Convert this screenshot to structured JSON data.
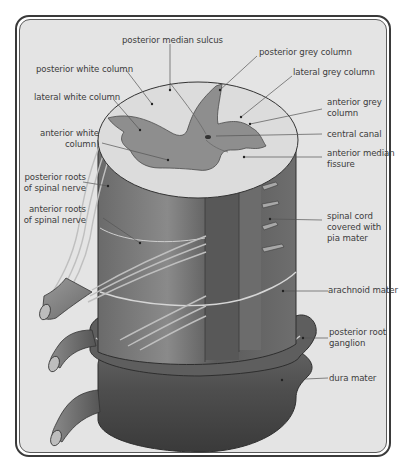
{
  "figure": {
    "colors": {
      "background": "#e4e4e4",
      "frame": "#3a3a3a",
      "white_matter": "#dcdcdc",
      "grey_matter": "#8e8e8e",
      "cord_dark": "#5e5e5e",
      "cord_mid": "#777777",
      "meninges_dark": "#4a4a4a",
      "label_text": "#3c3c3c",
      "leader_line": "#555555"
    },
    "labels": {
      "posterior_median_sulcus": "posterior median sulcus",
      "posterior_white_column": "posterior white column",
      "posterior_grey_column": "posterior grey column",
      "lateral_grey_column": "lateral grey column",
      "lateral_white_column": "lateral white column",
      "anterior_grey_column_1": "anterior grey",
      "anterior_grey_column_2": "column",
      "anterior_white_column_1": "anterior white",
      "anterior_white_column_2": "column",
      "central_canal": "central canal",
      "anterior_median_fissure_1": "anterior median",
      "anterior_median_fissure_2": "fissure",
      "posterior_roots_1": "posterior roots",
      "posterior_roots_2": "of spinal nerve",
      "anterior_roots_1": "anterior roots",
      "anterior_roots_2": "of spinal nerve",
      "spinal_cord_pia_1": "spinal cord",
      "spinal_cord_pia_2": "covered with",
      "spinal_cord_pia_3": "pia mater",
      "arachnoid_mater": "arachnoid mater",
      "posterior_root_ganglion_1": "posterior root",
      "posterior_root_ganglion_2": "ganglion",
      "dura_mater": "dura mater"
    }
  }
}
